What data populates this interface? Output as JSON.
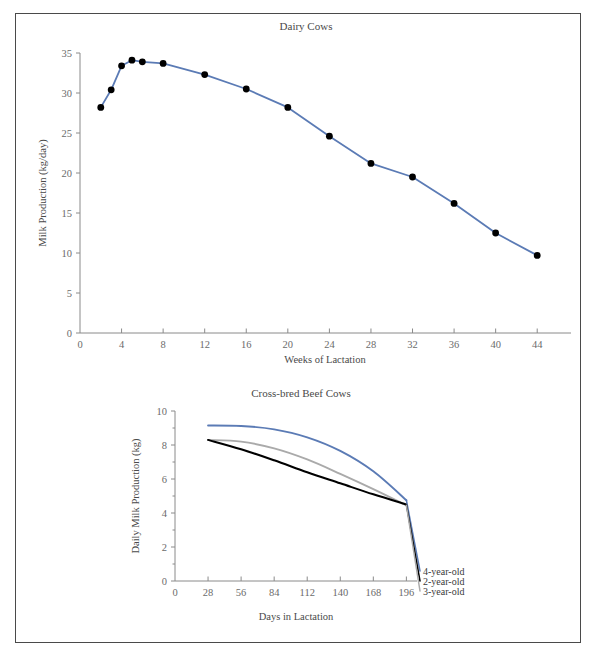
{
  "page": {
    "background_color": "#ffffff",
    "frame_color": "#4a4a4a"
  },
  "colors": {
    "blue": "#5b7bb5",
    "gray": "#aaaaaa",
    "black": "#000000",
    "axis": "#8a8a8a",
    "text": "#4a4a4a",
    "tick_text": "#6b6b6b"
  },
  "chart_data": [
    {
      "id": "dairy-cows",
      "type": "line",
      "title": "Dairy Cows",
      "xlabel": "Weeks of Lactation",
      "ylabel": "Milk Production (kg/day)",
      "xlim": [
        0,
        46
      ],
      "ylim": [
        0,
        35
      ],
      "xticks": [
        0,
        4,
        8,
        12,
        16,
        20,
        24,
        28,
        32,
        36,
        40,
        44
      ],
      "yticks": [
        0,
        5,
        10,
        15,
        20,
        25,
        30,
        35
      ],
      "grid": false,
      "legend": "none",
      "markers": "filled-circle",
      "series": [
        {
          "name": "Dairy Cows",
          "color": "#5b7bb5",
          "x": [
            2,
            3,
            4,
            5,
            6,
            8,
            12,
            16,
            20,
            24,
            28,
            32,
            36,
            40,
            44
          ],
          "values": [
            28.2,
            30.4,
            33.4,
            34.1,
            33.9,
            33.7,
            32.3,
            30.5,
            28.2,
            24.6,
            21.2,
            19.5,
            16.2,
            12.5,
            9.7
          ]
        }
      ]
    },
    {
      "id": "cross-bred-beef-cows",
      "type": "line",
      "title": "Cross-bred Beef Cows",
      "xlabel": "Days in Lactation",
      "ylabel": "Daily Milk Production (kg)",
      "xlim": [
        0,
        205
      ],
      "ylim": [
        0,
        10
      ],
      "xticks": [
        0,
        28,
        56,
        84,
        112,
        140,
        168,
        196
      ],
      "yticks": [
        0,
        2,
        4,
        6,
        8,
        10
      ],
      "yminorticks": [
        1,
        3,
        5,
        7,
        9
      ],
      "grid": false,
      "legend": "inline-right",
      "markers": "none",
      "series": [
        {
          "name": "4-year-old",
          "color": "#5b7bb5",
          "x": [
            28,
            56,
            84,
            112,
            140,
            168,
            196
          ],
          "values": [
            9.15,
            9.12,
            8.92,
            8.45,
            7.65,
            6.45,
            4.75
          ]
        },
        {
          "name": "3-year-old",
          "color": "#aaaaaa",
          "x": [
            28,
            56,
            84,
            112,
            140,
            168,
            196
          ],
          "values": [
            8.3,
            8.2,
            7.8,
            7.15,
            6.3,
            5.4,
            4.45
          ]
        },
        {
          "name": "2-year-old",
          "color": "#000000",
          "x": [
            28,
            56,
            84,
            112,
            140,
            168,
            196
          ],
          "values": [
            8.3,
            7.75,
            7.1,
            6.4,
            5.75,
            5.1,
            4.5
          ]
        }
      ]
    }
  ]
}
